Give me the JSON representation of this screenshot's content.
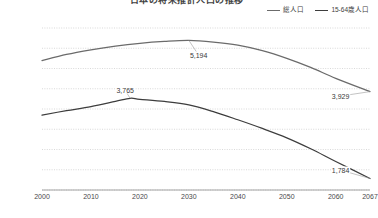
{
  "chart_data": {
    "type": "line",
    "title": "日本の将来推計人口の推移",
    "xlabel": "",
    "ylabel": "",
    "x": [
      2000,
      2010,
      2020,
      2030,
      2040,
      2050,
      2060,
      2067
    ],
    "xtick_labels": [
      "2000",
      "2010",
      "2020",
      "2030",
      "2040",
      "2050",
      "2060",
      "2067"
    ],
    "ytick_labels": [
      "5,500",
      "5,000",
      "4,500",
      "4,000",
      "3,500",
      "3,000",
      "2,500",
      "2,000",
      "1,500"
    ],
    "ytick_values": [
      5500,
      5000,
      4500,
      4000,
      3500,
      3000,
      2500,
      2000,
      1500
    ],
    "ylim": [
      1500,
      5500
    ],
    "xlim": [
      2000,
      2067
    ],
    "grid": true,
    "legend_position": "top-right",
    "series": [
      {
        "name": "総人口",
        "color": "#6b6b6b",
        "values": [
          4693,
          4961,
          5122,
          5192,
          5076,
          4750,
          4256,
          3929
        ],
        "x_dense": [
          2000,
          2005,
          2010,
          2015,
          2020,
          2025,
          2030,
          2035,
          2040,
          2045,
          2050,
          2055,
          2060,
          2067
        ],
        "values_dense": [
          4693,
          4847,
          4961,
          5054,
          5122,
          5167,
          5192,
          5152,
          5076,
          4940,
          4750,
          4520,
          4256,
          3929
        ]
      },
      {
        "name": "15-64歳人口",
        "color": "#3d3d3d",
        "values": [
          3351,
          3558,
          3740,
          3602,
          3234,
          2789,
          2204,
          1784
        ],
        "x_dense": [
          2000,
          2005,
          2010,
          2015,
          2018,
          2020,
          2025,
          2030,
          2035,
          2040,
          2045,
          2050,
          2055,
          2060,
          2067
        ],
        "values_dense": [
          3351,
          3459,
          3558,
          3687,
          3765,
          3740,
          3686,
          3602,
          3436,
          3234,
          3020,
          2789,
          2512,
          2204,
          1784
        ]
      }
    ],
    "annotations": [
      {
        "text": "5,194",
        "series": "総人口",
        "x": 2030,
        "y": 5194,
        "label_x": 2032,
        "label_y": 4830
      },
      {
        "text": "3,929",
        "series": "総人口",
        "x": 2067,
        "y": 3929,
        "label_x": 2061,
        "label_y": 3820
      },
      {
        "text": "3,765",
        "series": "15-64歳人口",
        "x": 2018,
        "y": 3765,
        "label_x": 2017,
        "label_y": 3960
      },
      {
        "text": "1,784",
        "series": "15-64歳人口",
        "x": 2067,
        "y": 1784,
        "label_x": 2061,
        "label_y": 1990
      }
    ]
  },
  "legend": {
    "items": [
      {
        "label": "総人口"
      },
      {
        "label": "15-64歳人口"
      }
    ]
  }
}
